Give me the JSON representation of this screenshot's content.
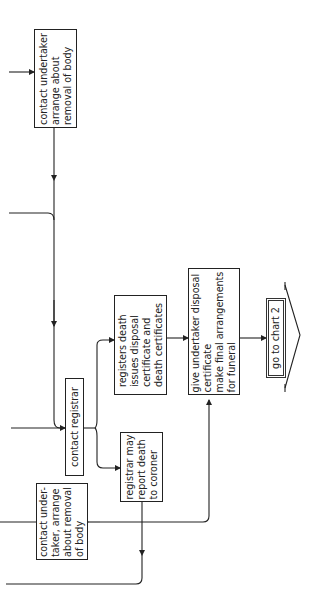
{
  "diagram": {
    "type": "flowchart",
    "orientation": "rotated 90deg counter-clockwise",
    "nodes": [
      {
        "id": "undertaker_top",
        "lines": [
          "contact undertaker",
          "arrange about",
          "removal of body"
        ]
      },
      {
        "id": "contact_registrar",
        "lines": [
          "contact registrar"
        ]
      },
      {
        "id": "undertaker_left",
        "lines": [
          "contact under-",
          "taker, arrange",
          "about removal",
          "of body"
        ]
      },
      {
        "id": "registers_death",
        "lines": [
          "registers death",
          "issues disposal",
          "certificate and",
          "death certificates"
        ]
      },
      {
        "id": "registrar_may_report",
        "lines": [
          "registrar may",
          "report death",
          "to coroner"
        ]
      },
      {
        "id": "give_undertaker",
        "lines": [
          "give undertaker disposal",
          "certificate",
          "make final arrangements",
          "for funeral"
        ]
      },
      {
        "id": "go_to_chart_2",
        "lines": [
          "go to chart 2"
        ]
      }
    ],
    "edges": [
      [
        "undertaker_top",
        "contact_registrar"
      ],
      [
        "contact_registrar",
        "registers_death"
      ],
      [
        "contact_registrar",
        "registrar_may_report"
      ],
      [
        "registers_death",
        "give_undertaker"
      ],
      [
        "undertaker_left",
        "give_undertaker"
      ],
      [
        "give_undertaker",
        "go_to_chart_2"
      ]
    ]
  },
  "nodes": {
    "n0": "contact undertaker\narrange about\nremoval of body",
    "n1": "contact registrar",
    "n2": "contact under-\ntaker, arrange\nabout removal\nof body",
    "n3": "registers death\nissues disposal\ncertificate and\ndeath certificates",
    "n4": "registrar may\nreport death\nto coroner",
    "n5": "give undertaker disposal\ncertificate\nmake final arrangements\nfor funeral",
    "n6": "go to chart 2"
  },
  "colors": {
    "line": "#222222",
    "background": "#ffffff"
  }
}
